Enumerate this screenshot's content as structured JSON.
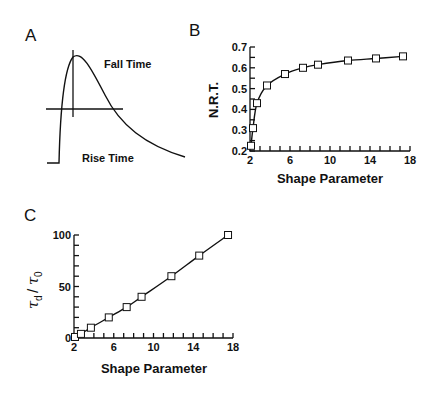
{
  "chart_data": [
    {
      "panel": "A",
      "type": "line",
      "title": "",
      "description": "Schematic waveform: step baseline, fast rise to peak, slower exponential-like decay; horizontal half-amplitude line and vertical line at peak",
      "annotations": [
        "Fall Time",
        "Rise Time"
      ],
      "xlabel": "",
      "ylabel": ""
    },
    {
      "panel": "B",
      "type": "line",
      "title": "",
      "xlabel": "Shape Parameter",
      "ylabel": "N.R.T.",
      "xlim": [
        2,
        18
      ],
      "ylim": [
        0.2,
        0.7
      ],
      "xticks": [
        "2",
        "6",
        "10",
        "14",
        "18"
      ],
      "yticks": [
        "0.2",
        "0.3",
        "0.4",
        "0.5",
        "0.6",
        "0.7"
      ],
      "series": [
        {
          "name": "N.R.T.",
          "marker": "open-square",
          "x": [
            2.1,
            2.3,
            2.7,
            3.7,
            5.5,
            7.3,
            8.8,
            11.8,
            14.6,
            17.3
          ],
          "y": [
            0.225,
            0.31,
            0.43,
            0.515,
            0.57,
            0.6,
            0.615,
            0.635,
            0.645,
            0.655
          ]
        }
      ],
      "grid": false
    },
    {
      "panel": "C",
      "type": "line",
      "title": "",
      "xlabel": "Shape Parameter",
      "ylabel": "τd/τ0",
      "xlim": [
        2,
        18
      ],
      "ylim": [
        0,
        100
      ],
      "xticks": [
        "2",
        "6",
        "10",
        "14",
        "18"
      ],
      "yticks": [
        "0",
        "50",
        "100"
      ],
      "series": [
        {
          "name": "τd/τ0",
          "marker": "open-square",
          "x": [
            2.1,
            2.7,
            3.7,
            5.5,
            7.3,
            8.8,
            11.8,
            14.6,
            17.5
          ],
          "y": [
            1,
            4,
            10,
            20,
            30,
            40,
            60,
            80,
            100
          ]
        }
      ],
      "grid": false
    }
  ],
  "labels": {
    "panel_a": "A",
    "panel_b": "B",
    "panel_c": "C",
    "fall_time": "Fall Time",
    "rise_time": "Rise Time",
    "b_ylabel": "N.R.T.",
    "b_xlabel": "Shape Parameter",
    "c_xlabel": "Shape Parameter",
    "c_ylabel_main": "τ",
    "c_ylabel_sub1": "d",
    "c_ylabel_slash": "/",
    "c_ylabel_sub2": "0"
  }
}
